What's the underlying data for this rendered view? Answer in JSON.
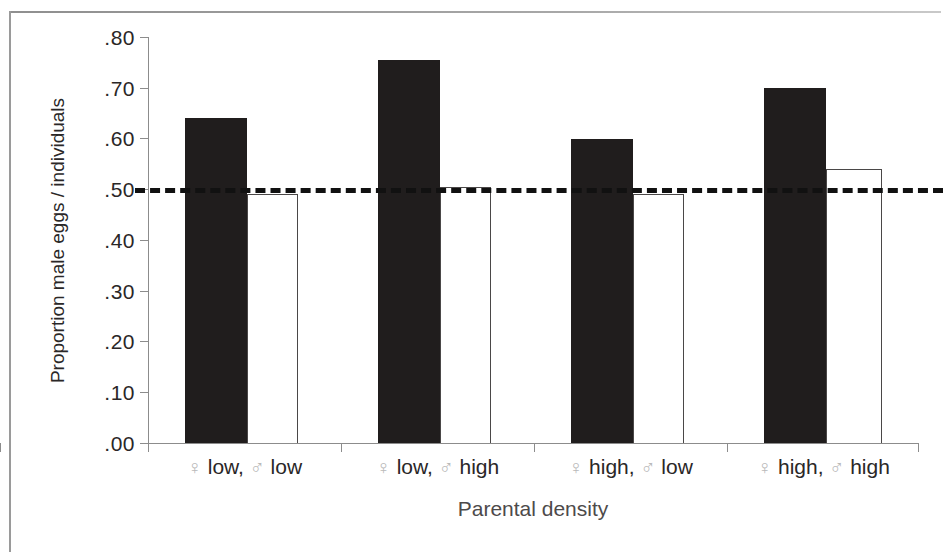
{
  "chart_data": {
    "type": "bar",
    "title": "",
    "xlabel": "Parental density",
    "ylabel": "Proportion male eggs / individuals",
    "categories": [
      "♀ low, ♂ low",
      "♀ low, ♂ high",
      "♀ high, ♂ low",
      "♀ high, ♂ high"
    ],
    "category_parts": [
      {
        "female_symbol": "♀",
        "female_level": "low,",
        "male_symbol": "♂",
        "male_level": "low"
      },
      {
        "female_symbol": "♀",
        "female_level": "low,",
        "male_symbol": "♂",
        "male_level": "high"
      },
      {
        "female_symbol": "♀",
        "female_level": "high,",
        "male_symbol": "♂",
        "male_level": "low"
      },
      {
        "female_symbol": "♀",
        "female_level": "high,",
        "male_symbol": "♂",
        "male_level": "high"
      }
    ],
    "series": [
      {
        "name": "eggs",
        "style": "filled-black",
        "color": "#201d1d",
        "values": [
          0.64,
          0.755,
          0.6,
          0.7
        ]
      },
      {
        "name": "individuals",
        "style": "open-white",
        "color": "#ffffff",
        "values": [
          0.49,
          0.505,
          0.49,
          0.54
        ]
      }
    ],
    "ylim": [
      0.0,
      0.8
    ],
    "ytick_values": [
      0.8,
      0.7,
      0.6,
      0.5,
      0.4,
      0.3,
      0.2,
      0.1,
      0.0
    ],
    "ytick_labels": [
      ".80",
      ".70",
      ".60",
      ".50",
      ".40",
      ".30",
      ".20",
      ".10",
      ".00"
    ],
    "reference_line": {
      "value": 0.5,
      "style": "dashed",
      "color": "#111111"
    },
    "grid": false,
    "legend": "none"
  }
}
